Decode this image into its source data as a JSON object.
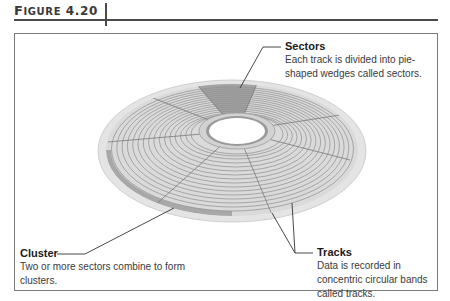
{
  "figure": {
    "label_first": "F",
    "label_rest": "IGURE",
    "number": "4.20"
  },
  "callouts": {
    "sectors": {
      "title": "Sectors",
      "description": "Each track is divided into pie-shaped wedges called sectors."
    },
    "cluster": {
      "title": "Cluster",
      "description": "Two or more sectors combine to form clusters."
    },
    "tracks": {
      "title": "Tracks",
      "description": "Data is recorded in concentric circular bands called tracks."
    }
  },
  "colors": {
    "disk_base": "#d9d9d9",
    "track_line": "#8c8c8c",
    "highlight_sector": "#9e9e9e",
    "highlight_cluster": "#a8a8a8",
    "rim": "#e6e6e6",
    "leader_line": "#333333"
  }
}
